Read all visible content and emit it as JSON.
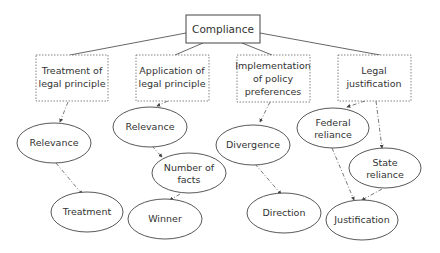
{
  "diagram": {
    "root": {
      "label": "Compliance"
    },
    "categories": [
      {
        "lines": [
          "Treatment of",
          "legal principle"
        ]
      },
      {
        "lines": [
          "Application of",
          "legal principle"
        ]
      },
      {
        "lines": [
          "Implementation",
          "of policy",
          "preferences"
        ]
      },
      {
        "lines": [
          "Legal",
          "justification"
        ]
      }
    ],
    "nodes": {
      "relevance1": {
        "lines": [
          "Relevance"
        ]
      },
      "treatment": {
        "lines": [
          "Treatment"
        ]
      },
      "relevance2": {
        "lines": [
          "Relevance"
        ]
      },
      "number_of_facts": {
        "lines": [
          "Number of",
          "facts"
        ]
      },
      "winner": {
        "lines": [
          "Winner"
        ]
      },
      "divergence": {
        "lines": [
          "Divergence"
        ]
      },
      "direction": {
        "lines": [
          "Direction"
        ]
      },
      "federal_reliance": {
        "lines": [
          "Federal",
          "reliance"
        ]
      },
      "state_reliance": {
        "lines": [
          "State",
          "reliance"
        ]
      },
      "justification": {
        "lines": [
          "Justification"
        ]
      }
    },
    "edges": [
      {
        "from": "Compliance",
        "to": "Treatment of legal principle",
        "style": "solid"
      },
      {
        "from": "Compliance",
        "to": "Application of legal principle",
        "style": "solid"
      },
      {
        "from": "Compliance",
        "to": "Implementation of policy preferences",
        "style": "solid"
      },
      {
        "from": "Compliance",
        "to": "Legal justification",
        "style": "solid"
      },
      {
        "from": "Treatment of legal principle",
        "to": "Relevance",
        "style": "dash-dot"
      },
      {
        "from": "Relevance",
        "to": "Treatment",
        "style": "dash-dot"
      },
      {
        "from": "Application of legal principle",
        "to": "Relevance",
        "style": "dash-dot"
      },
      {
        "from": "Relevance",
        "to": "Number of facts",
        "style": "dash-dot"
      },
      {
        "from": "Number of facts",
        "to": "Winner",
        "style": "dash-dot"
      },
      {
        "from": "Implementation of policy preferences",
        "to": "Divergence",
        "style": "dash-dot"
      },
      {
        "from": "Divergence",
        "to": "Direction",
        "style": "dash-dot"
      },
      {
        "from": "Legal justification",
        "to": "Federal reliance",
        "style": "dash-dot"
      },
      {
        "from": "Legal justification",
        "to": "State reliance",
        "style": "dash-dot"
      },
      {
        "from": "Federal reliance",
        "to": "Justification",
        "style": "dash-dot"
      },
      {
        "from": "State reliance",
        "to": "Justification",
        "style": "dash-dot"
      }
    ],
    "colors": {
      "stroke": "#444444",
      "text": "#333333",
      "background": "#ffffff"
    }
  }
}
